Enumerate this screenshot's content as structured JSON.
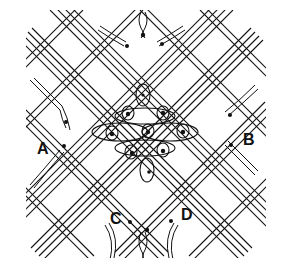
{
  "diagram": {
    "type": "lace-pattern",
    "labels": [
      {
        "id": "A",
        "text": "A"
      },
      {
        "id": "B",
        "text": "B"
      },
      {
        "id": "C",
        "text": "C"
      },
      {
        "id": "D",
        "text": "D"
      }
    ],
    "colors": {
      "line": "#111111",
      "background": "#ffffff"
    }
  }
}
